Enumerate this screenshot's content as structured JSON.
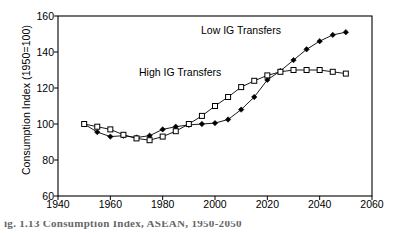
{
  "figure": {
    "caption": "ig. 1.13   Consumption Index, ASEAN, 1950-2050"
  },
  "chart_data": {
    "type": "line",
    "title": "",
    "xlabel": "",
    "ylabel": "Consumption Index (1950=100)",
    "xlim": [
      1940,
      2060
    ],
    "ylim": [
      60,
      160
    ],
    "xticks": [
      1940,
      1960,
      1980,
      2000,
      2020,
      2040,
      2060
    ],
    "yticks": [
      60,
      80,
      100,
      120,
      140,
      160
    ],
    "grid": false,
    "legend_position": "inline-annotations",
    "x": [
      1950,
      1955,
      1960,
      1965,
      1970,
      1975,
      1980,
      1985,
      1990,
      1995,
      2000,
      2005,
      2010,
      2015,
      2020,
      2025,
      2030,
      2035,
      2040,
      2045,
      2050
    ],
    "series": [
      {
        "name": "Low IG Transfers",
        "marker": "filled-diamond",
        "values": [
          100,
          95.5,
          93,
          93.5,
          92.5,
          93.5,
          97,
          98.5,
          99.5,
          100,
          100.5,
          102.5,
          108,
          115,
          124.5,
          129.5,
          135.5,
          141.5,
          146,
          149.5,
          151
        ]
      },
      {
        "name": "High IG Transfers",
        "marker": "open-square",
        "values": [
          100,
          98.5,
          97,
          94,
          92,
          91,
          93,
          96,
          100,
          104.5,
          110,
          115,
          120.5,
          124,
          127,
          129,
          130,
          130,
          130,
          129,
          128
        ]
      }
    ],
    "annotations": [
      {
        "text": "Low IG Transfers",
        "x": 2005,
        "y": 153
      },
      {
        "text": "High IG Transfers",
        "x": 1982,
        "y": 131
      }
    ]
  }
}
